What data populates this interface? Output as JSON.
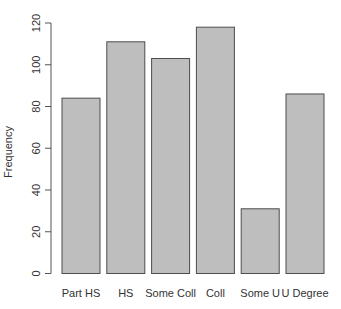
{
  "chart_data": {
    "type": "bar",
    "title": "",
    "xlabel": "",
    "ylabel": "Frequency",
    "categories": [
      "Part HS",
      "HS",
      "Some Coll",
      "Coll",
      "Some U",
      "U Degree"
    ],
    "values": [
      84,
      111,
      103,
      118,
      31,
      86
    ],
    "ylim": [
      0,
      120
    ],
    "yticks": [
      0,
      20,
      40,
      60,
      80,
      100,
      120
    ],
    "ytick_labels": [
      "0",
      "20",
      "40",
      "60",
      "80",
      "100",
      "120"
    ],
    "grid": false,
    "legend": null,
    "colors": {
      "bar_fill": "#bebebe",
      "bar_stroke": "#4d4d4d",
      "axis": "#555555",
      "text": "#333333"
    }
  }
}
